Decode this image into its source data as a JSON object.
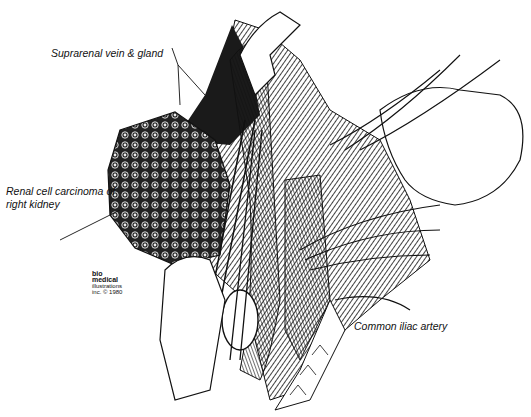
{
  "figure": {
    "type": "surgical illustration",
    "labels": {
      "suprarenal": "Suprarenal vein & gland",
      "carcinoma_line1": "Renal cell carcinoma of",
      "carcinoma_line2": "right kidney",
      "iliac": "Common iliac artery"
    },
    "credit": {
      "line1": "bio",
      "line2": "medical",
      "line3": "illustrations",
      "line4": "inc. © 1980"
    }
  }
}
